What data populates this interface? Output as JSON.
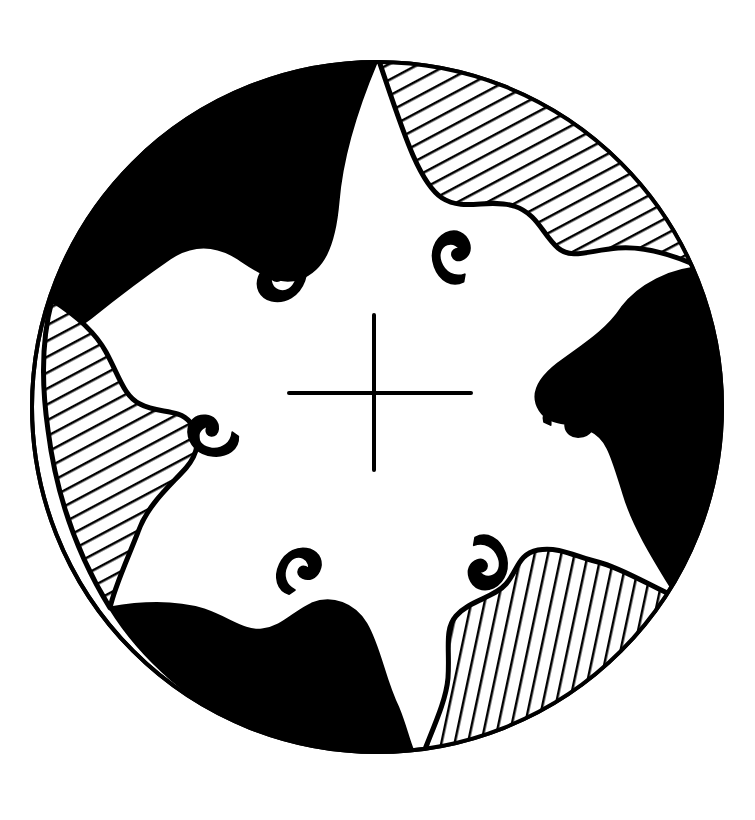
{
  "figure": {
    "title": "Circular cosmological mandala diagram",
    "medium": "pen-and-ink line drawing",
    "background_color": "#ffffff",
    "ink_color": "#000000",
    "canvas": {
      "width": 755,
      "height": 820
    }
  },
  "circle": {
    "name": "outer-rim",
    "center_x": 377,
    "center_y": 407,
    "radius": 345,
    "stroke_width": 4,
    "stroke_color": "#000000",
    "fill_color": "#ffffff"
  },
  "cross": {
    "name": "central-cross",
    "center_x": 374,
    "center_y": 393,
    "arm_up": 78,
    "arm_down": 77,
    "arm_left": 85,
    "arm_right": 97,
    "stroke_width": 4,
    "stroke_color": "#000000"
  },
  "lobes": [
    {
      "id": "lobe-top-left",
      "label": "Top-left lobe",
      "fill_style": "solid-black",
      "fill_color": "#000000",
      "angle_start_deg": 178,
      "angle_end_deg": 268,
      "path": "M 57 285 C 70 200 120 130 200 92 C 265 62 320 58 372 62 C 356 100 340 150 336 200 C 332 246 320 268 300 276 C 280 284 258 268 240 256 C 218 242 196 240 172 256 C 140 278 112 300 92 316 C 78 327 64 318 57 285 Z"
    },
    {
      "id": "lobe-top-right",
      "label": "Top-right lobe",
      "fill_style": "diagonal-hatch",
      "fill_color": "#ffffff",
      "hatch_angle_deg": 28,
      "hatch_spacing": 14,
      "hatch_stroke_width": 5,
      "angle_start_deg": 88,
      "angle_end_deg": 2,
      "path": "M 374 62 C 430 62 492 76 548 108 C 608 142 660 196 690 262 C 666 250 640 244 616 246 C 588 248 570 258 556 246 C 540 232 536 212 512 204 C 486 196 462 210 440 196 C 416 180 400 130 374 62 Z"
    },
    {
      "id": "lobe-right",
      "label": "Right lobe",
      "fill_style": "solid-black",
      "fill_color": "#000000",
      "angle_start_deg": 352,
      "angle_end_deg": 300,
      "path": "M 690 262 C 712 312 722 372 718 424 C 714 486 698 540 670 588 C 650 556 630 524 620 492 C 608 454 606 436 588 428 C 566 418 548 424 538 408 C 528 392 538 376 556 362 C 580 344 604 330 620 306 C 634 286 662 270 690 262 Z"
    },
    {
      "id": "lobe-bottom-right",
      "label": "Bottom-right lobe",
      "fill_style": "vertical-hatch",
      "fill_color": "#ffffff",
      "hatch_angle_deg": 78,
      "hatch_spacing": 13,
      "hatch_stroke_width": 5,
      "angle_start_deg": 296,
      "angle_end_deg": 246,
      "path": "M 670 588 C 642 634 606 676 562 708 C 518 740 470 754 428 752 C 438 724 450 700 452 676 C 454 646 448 628 460 614 C 474 598 496 596 508 582 C 520 568 520 552 540 548 C 562 544 580 556 600 560 C 622 564 648 580 670 588 Z"
    },
    {
      "id": "lobe-bottom-left",
      "label": "Bottom-left lobe",
      "fill_style": "solid-black",
      "fill_color": "#000000",
      "angle_start_deg": 242,
      "angle_end_deg": 182,
      "path": "M 428 752 C 376 756 320 748 266 724 C 208 698 156 654 124 602 C 152 600 180 600 204 608 C 232 618 244 630 262 628 C 282 626 294 610 312 602 C 332 594 352 602 364 622 C 378 646 382 678 396 706 C 406 728 416 744 428 752 Z"
    },
    {
      "id": "lobe-left",
      "label": "Left lobe",
      "fill_style": "diagonal-hatch",
      "fill_color": "#ffffff",
      "hatch_angle_deg": 28,
      "hatch_spacing": 14,
      "hatch_stroke_width": 5,
      "angle_start_deg": 178,
      "angle_end_deg": 128,
      "path": "M 124 602 C 92 552 70 492 62 428 C 54 372 54 322 57 285 C 76 306 94 326 106 348 C 120 374 124 392 140 400 C 158 410 178 404 190 418 C 202 432 198 450 186 464 C 170 482 148 500 138 528 C 130 552 126 578 124 602 Z"
    }
  ],
  "motifs": [
    {
      "id": "motif-upper-left",
      "label": "Upper-left comma motif",
      "shape": "hooked-flame",
      "center_x": 283,
      "center_y": 275,
      "rotation_deg": 20,
      "scale": 1.0
    },
    {
      "id": "motif-upper-right",
      "label": "Upper-right comma motif",
      "shape": "hooked-flame",
      "center_x": 453,
      "center_y": 258,
      "rotation_deg": 160,
      "scale": 0.92
    },
    {
      "id": "motif-left",
      "label": "Left comma motif",
      "shape": "hooked-flame",
      "center_x": 213,
      "center_y": 436,
      "rotation_deg": 95,
      "scale": 0.9
    },
    {
      "id": "motif-right",
      "label": "Right comma motif",
      "shape": "hooked-flame",
      "center_x": 569,
      "center_y": 418,
      "rotation_deg": 265,
      "scale": 0.9
    },
    {
      "id": "motif-lower-left",
      "label": "Lower-left comma motif",
      "shape": "hooked-flame",
      "center_x": 298,
      "center_y": 571,
      "rotation_deg": 205,
      "scale": 0.88
    },
    {
      "id": "motif-lower-right",
      "label": "Lower-right comma motif",
      "shape": "hooked-flame",
      "center_x": 486,
      "center_y": 562,
      "rotation_deg": 340,
      "scale": 0.95
    }
  ],
  "counts": {
    "lobes_total": 6,
    "lobes_solid_black": 3,
    "lobes_hatched": 3,
    "motifs_total": 6,
    "cross_arms": 4
  }
}
